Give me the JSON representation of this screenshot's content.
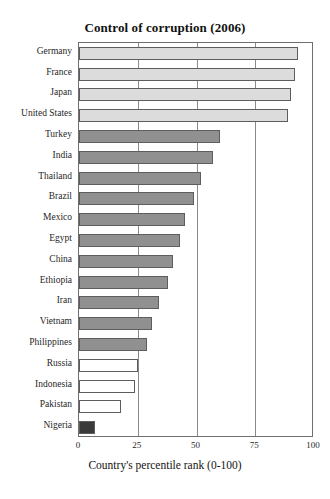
{
  "chart_data": {
    "type": "bar",
    "orientation": "horizontal",
    "title": "Control of corruption (2006)",
    "xlabel": "Country's percentile rank (0-100)",
    "ylabel": "",
    "xlim": [
      0,
      100
    ],
    "xticks": [
      0,
      25,
      50,
      75,
      100
    ],
    "grid": true,
    "legend": "none",
    "categories": [
      "Germany",
      "France",
      "Japan",
      "United States",
      "Turkey",
      "India",
      "Thailand",
      "Brazil",
      "Mexico",
      "Egypt",
      "China",
      "Ethiopia",
      "Iran",
      "Vietnam",
      "Philippines",
      "Russia",
      "Indonesia",
      "Pakistan",
      "Nigeria"
    ],
    "values": [
      93,
      92,
      90,
      89,
      60,
      57,
      52,
      49,
      45,
      43,
      40,
      38,
      34,
      31,
      29,
      25,
      24,
      18,
      7
    ],
    "bar_colors": [
      "#dcdcdc",
      "#dcdcdc",
      "#dcdcdc",
      "#dcdcdc",
      "#909090",
      "#909090",
      "#909090",
      "#909090",
      "#909090",
      "#909090",
      "#909090",
      "#909090",
      "#909090",
      "#909090",
      "#909090",
      "#ffffff",
      "#ffffff",
      "#ffffff",
      "#3a3a3a"
    ]
  },
  "colors": {
    "light_group": "#dcdcdc",
    "mid_group": "#909090",
    "empty_group": "#ffffff",
    "dark_group": "#3a3a3a",
    "frame": "#6f6f6f",
    "grid": "#8a8a8a",
    "background": "#ffffff",
    "text": "#1a1a1a"
  }
}
